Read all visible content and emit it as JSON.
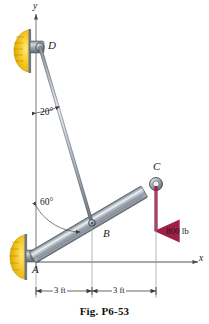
{
  "figure": {
    "caption": "Fig. P6-53",
    "axes": {
      "y_label": "y",
      "x_label": "x"
    },
    "points": [
      {
        "id": "A",
        "label": "A",
        "x": 35,
        "y": 256,
        "role": "pin-support-wall"
      },
      {
        "id": "B",
        "label": "B",
        "x": 92,
        "y": 223,
        "role": "pin-joint"
      },
      {
        "id": "C",
        "label": "C",
        "x": 156,
        "y": 184,
        "role": "pin-end"
      },
      {
        "id": "D",
        "label": "D",
        "x": 40,
        "y": 47,
        "role": "pin-support-wall"
      }
    ],
    "members": [
      {
        "id": "AC",
        "from": "A",
        "to": "C",
        "style": "beam"
      },
      {
        "id": "DB",
        "from": "D",
        "to": "B",
        "style": "rod"
      }
    ],
    "angles": [
      {
        "id": "angle-at-D",
        "label": "20°",
        "value": 20,
        "unit": "deg",
        "from": "y-axis",
        "to": "member-DB"
      },
      {
        "id": "angle-at-A",
        "label": "60°",
        "value": 60,
        "unit": "deg",
        "from": "y-axis",
        "to": "member-AC"
      }
    ],
    "loads": [
      {
        "id": "load-at-C",
        "label": "800 lb",
        "magnitude": 800,
        "unit": "lb",
        "direction": "down",
        "applied_at": "C",
        "color": "#a01f47"
      }
    ],
    "dimensions": [
      {
        "id": "dim-A-B",
        "label": "3 ft",
        "value": 3,
        "unit": "ft",
        "from": "A",
        "to": "B"
      },
      {
        "id": "dim-B-C",
        "label": "3 ft",
        "value": 3,
        "unit": "ft",
        "from": "B",
        "to": "C"
      }
    ],
    "colors": {
      "wall_support": "#f5c518",
      "wall_support_dark": "#c99a0a",
      "beam_light": "#d9dde3",
      "beam_mid": "#9aa3ad",
      "beam_dark": "#5d6670",
      "load_arrow": "#a01f47",
      "line": "#3a3a3a"
    }
  }
}
